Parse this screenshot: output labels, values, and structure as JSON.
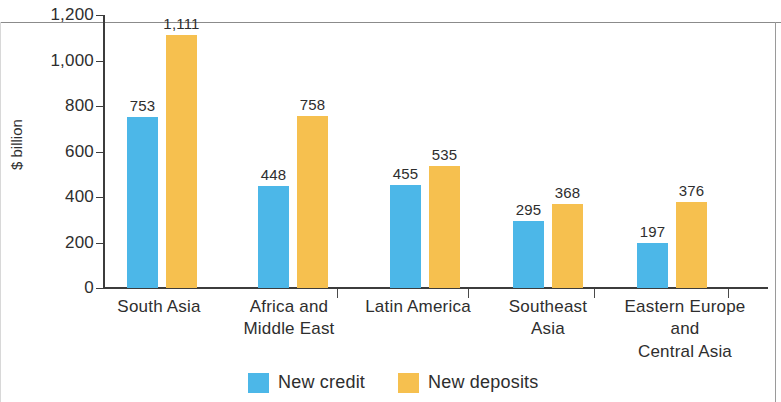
{
  "chart_data": {
    "type": "bar",
    "title": "",
    "xlabel": "",
    "ylabel": "$ billion",
    "ylim": [
      0,
      1200
    ],
    "ytick_values": [
      0,
      200,
      400,
      600,
      800,
      1000,
      1200
    ],
    "ytick_labels": [
      "0",
      "200",
      "400",
      "600",
      "800",
      "1,000",
      "1,200"
    ],
    "grid": false,
    "legend_position": "bottom",
    "categories": [
      "South Asia",
      "Africa and Middle East",
      "Latin America",
      "Southeast Asia",
      "Eastern Europe and Central Asia"
    ],
    "category_label_lines": [
      [
        "South Asia"
      ],
      [
        "Africa and",
        "Middle East"
      ],
      [
        "Latin America"
      ],
      [
        "Southeast",
        "Asia"
      ],
      [
        "Eastern Europe",
        "and",
        "Central Asia"
      ]
    ],
    "series": [
      {
        "name": "New credit",
        "color": "#4CB7E8",
        "values": [
          753,
          448,
          455,
          295,
          197
        ],
        "value_labels": [
          "753",
          "448",
          "455",
          "295",
          "197"
        ]
      },
      {
        "name": "New deposits",
        "color": "#F6C04F",
        "values": [
          1111,
          758,
          535,
          368,
          376
        ],
        "value_labels": [
          "1,111",
          "758",
          "535",
          "368",
          "376"
        ]
      }
    ]
  },
  "legend": {
    "items": [
      {
        "label": "New credit",
        "color": "#4CB7E8"
      },
      {
        "label": "New deposits",
        "color": "#F6C04F"
      }
    ]
  },
  "axis": {
    "y_title": "$ billion"
  }
}
